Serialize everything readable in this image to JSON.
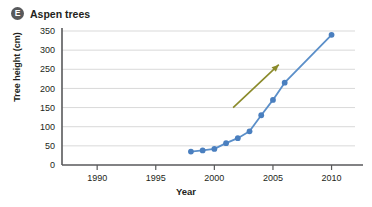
{
  "panel": {
    "badge_letter": "E",
    "title": "Aspen trees"
  },
  "colors": {
    "series_line": "#5b8fc9",
    "series_marker": "#4a7fbf",
    "annotation_arrow": "#8a8a2a",
    "gridline": "#d9d9d9",
    "axis": "#58595b",
    "badge_background": "#58595b",
    "text": "#231f20"
  },
  "chart_data": {
    "type": "line",
    "title": "Aspen trees",
    "xlabel": "Year",
    "ylabel": "Tree height (cm)",
    "xlim": [
      1987,
      2012
    ],
    "ylim": [
      0,
      350
    ],
    "xticks": [
      1990,
      1995,
      2000,
      2005,
      2010
    ],
    "yticks": [
      0,
      50,
      100,
      150,
      200,
      250,
      300,
      350
    ],
    "grid": "horizontal",
    "legend": "none",
    "series": [
      {
        "name": "Aspen tree height",
        "x": [
          1998,
          1999,
          2000,
          2001,
          2002,
          2003,
          2004,
          2005,
          2006,
          2010
        ],
        "values": [
          35,
          38,
          42,
          57,
          70,
          88,
          130,
          170,
          215,
          340
        ]
      }
    ],
    "annotations": [
      {
        "type": "arrow",
        "label": "growth trend arrow",
        "from": [
          2001.6,
          150
        ],
        "to": [
          2005.5,
          262
        ]
      }
    ]
  }
}
